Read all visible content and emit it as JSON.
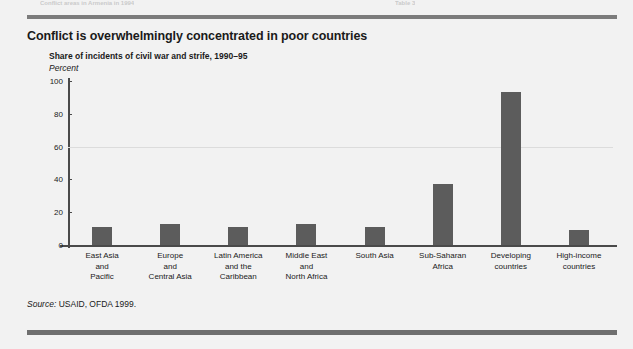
{
  "page": {
    "background_color": "#f2f2f2",
    "rule_color": "#7c7c7c",
    "cropped_header_left": "Conflict areas in Armenia in 1994",
    "cropped_header_right": "Table 3"
  },
  "figure": {
    "title": "Conflict is overwhelmingly concentrated in poor countries",
    "subtitle": "Share of incidents of civil war and strife, 1990–95",
    "unit_label": "Percent",
    "source_keyword": "Source:",
    "source_text": " USAID, OFDA 1999."
  },
  "chart_data": {
    "type": "bar",
    "title": "Conflict is overwhelmingly concentrated in poor countries",
    "subtitle": "Share of incidents of civil war and strife, 1990–95",
    "xlabel": "",
    "ylabel": "Percent",
    "ylim": [
      0,
      100
    ],
    "yticks": [
      0,
      20,
      40,
      60,
      80,
      100
    ],
    "grid": "faint horizontal line at 60",
    "legend": "none",
    "bar_color": "#5c5c5c",
    "categories": [
      "East Asia\nand\nPacific",
      "Europe\nand\nCentral Asia",
      "Latin America\nand the\nCaribbean",
      "Middle East\nand\nNorth Africa",
      "South Asia",
      "Sub-Saharan\nAfrica",
      "Developing\ncountries",
      "High-income\ncountries"
    ],
    "values": [
      11,
      13,
      11,
      13,
      11,
      37,
      93,
      9
    ]
  }
}
